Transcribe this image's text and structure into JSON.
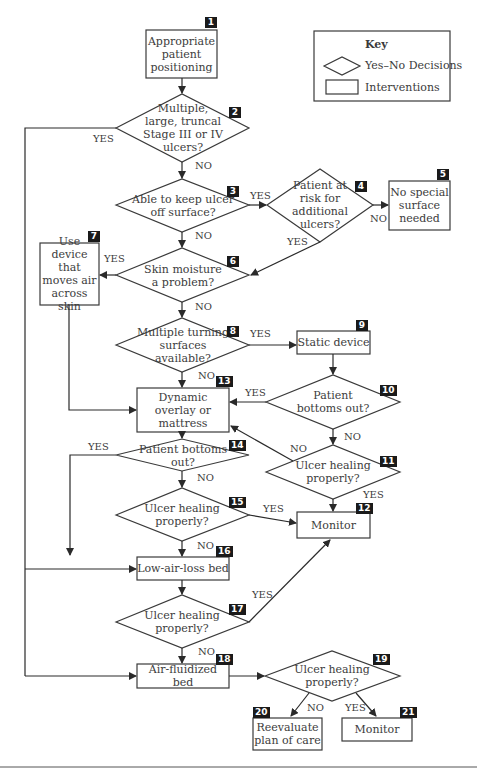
{
  "key": {
    "title": "Key",
    "decision_label": "Yes–No Decisions",
    "intervention_label": "Interventions"
  },
  "nodes": {
    "n1": {
      "num": "1",
      "type": "intervention",
      "text": "Appropriate patient positioning"
    },
    "n2": {
      "num": "2",
      "type": "decision",
      "text": "Multiple, large, truncal Stage III or IV ulcers?"
    },
    "n3": {
      "num": "3",
      "type": "decision",
      "text": "Able to keep ulcer off surface?"
    },
    "n4": {
      "num": "4",
      "type": "decision",
      "text": "Patient at risk for additional ulcers?"
    },
    "n5": {
      "num": "5",
      "type": "intervention",
      "text": "No special surface needed"
    },
    "n6": {
      "num": "6",
      "type": "decision",
      "text": "Skin moisture a problem?"
    },
    "n7": {
      "num": "7",
      "type": "intervention",
      "text": "Use device that moves air across skin"
    },
    "n8": {
      "num": "8",
      "type": "decision",
      "text": "Multiple turning surfaces available?"
    },
    "n9": {
      "num": "9",
      "type": "intervention",
      "text": "Static device"
    },
    "n10": {
      "num": "10",
      "type": "decision",
      "text": "Patient bottoms out?"
    },
    "n11": {
      "num": "11",
      "type": "decision",
      "text": "Ulcer healing properly?"
    },
    "n12": {
      "num": "12",
      "type": "intervention",
      "text": "Monitor"
    },
    "n13": {
      "num": "13",
      "type": "intervention",
      "text": "Dynamic overlay or mattress"
    },
    "n14": {
      "num": "14",
      "type": "decision",
      "text": "Patient bottoms out?"
    },
    "n15": {
      "num": "15",
      "type": "decision",
      "text": "Ulcer healing properly?"
    },
    "n16": {
      "num": "16",
      "type": "intervention",
      "text": "Low-air-loss bed"
    },
    "n17": {
      "num": "17",
      "type": "decision",
      "text": "Ulcer healing properly?"
    },
    "n18": {
      "num": "18",
      "type": "intervention",
      "text": "Air-fluidized bed"
    },
    "n19": {
      "num": "19",
      "type": "decision",
      "text": "Ulcer healing properly?"
    },
    "n20": {
      "num": "20",
      "type": "intervention",
      "text": "Reevaluate plan of care"
    },
    "n21": {
      "num": "21",
      "type": "intervention",
      "text": "Monitor"
    }
  },
  "edges": {
    "yes": "YES",
    "no": "NO"
  }
}
